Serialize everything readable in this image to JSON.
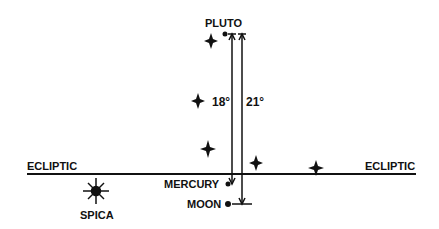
{
  "diagram": {
    "ecliptic_label_left": "ECLIPTIC",
    "ecliptic_label_right": "ECLIPTIC",
    "pluto_label": "PLUTO",
    "mercury_label": "MERCURY",
    "moon_label": "MOON",
    "spica_label": "SPICA",
    "angle_mercury": "18°",
    "angle_moon": "21°"
  }
}
